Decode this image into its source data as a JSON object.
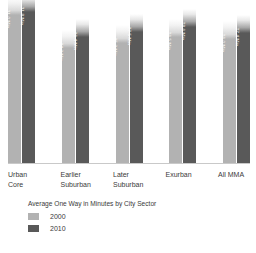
{
  "chart_data": {
    "type": "bar",
    "title": "",
    "xlabel": "",
    "ylabel": "",
    "ylim": [
      0,
      34
    ],
    "grid": false,
    "legend_position": "bottom-left",
    "legend_title": "Average One Way in Minutes by City Sector",
    "categories": [
      "Urban Core",
      "Earlier Suburban",
      "Later Suburban",
      "Exurban",
      "All MMA"
    ],
    "series": [
      {
        "name": "2000",
        "color": "#b2b2b2",
        "values": [
          31.0,
          24.3,
          25.3,
          26.5,
          26.0
        ],
        "labels": [
          "31.0 Min",
          "24.3 Min",
          "25.3 Min",
          "26.5 Min",
          "26.0 Min"
        ]
      },
      {
        "name": "2010",
        "color": "#595959",
        "values": [
          31.8,
          26.4,
          27.5,
          28.6,
          27.4
        ],
        "labels": [
          "31.8 Min",
          "26.4 Min",
          "27.5 Min",
          "28.6 Min",
          "27.4 Min"
        ]
      }
    ]
  },
  "categories": [
    {
      "label": "Urban Core"
    },
    {
      "label": "Earlier Suburban"
    },
    {
      "label": "Later Suburban"
    },
    {
      "label": "Exurban"
    },
    {
      "label": "All MMA"
    }
  ],
  "legend": {
    "title": "Average One Way in Minutes by City Sector",
    "items": [
      {
        "label": "2000",
        "color": "#b2b2b2"
      },
      {
        "label": "2010",
        "color": "#595959"
      }
    ]
  }
}
